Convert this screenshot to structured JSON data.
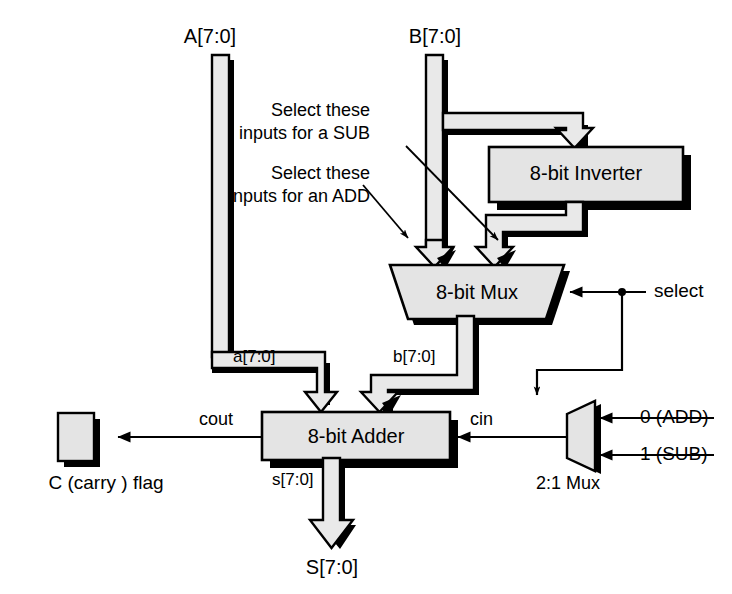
{
  "diagram": {
    "colors": {
      "bus_fill": "#e9e9e9",
      "block_fill": "#e4e4e4",
      "stroke": "#000000",
      "shadow": "#000000",
      "background": "#ffffff"
    }
  },
  "inputs": {
    "a_bus": "A[7:0]",
    "b_bus": "B[7:0]"
  },
  "blocks": {
    "inverter": "8-bit Inverter",
    "mux8": "8-bit Mux",
    "adder": "8-bit Adder",
    "mux21": "2:1 Mux",
    "carry_flag": "C (carry ) flag"
  },
  "annotations": {
    "sub_note": "Select these\ninputs for a SUB",
    "sub_note_line1": "Select these",
    "sub_note_line2": "inputs for a SUB",
    "add_note_line1": "Select these",
    "add_note_line2": "inputs for an ADD"
  },
  "signals": {
    "a_internal": "a[7:0]",
    "b_internal": "b[7:0]",
    "cout": "cout",
    "cin": "cin",
    "s_internal": "s[7:0]",
    "select": "select",
    "sum_out": "S[7:0]"
  },
  "mux21_inputs": [
    {
      "label": "0 (ADD)"
    },
    {
      "label": "1 (SUB)"
    }
  ]
}
